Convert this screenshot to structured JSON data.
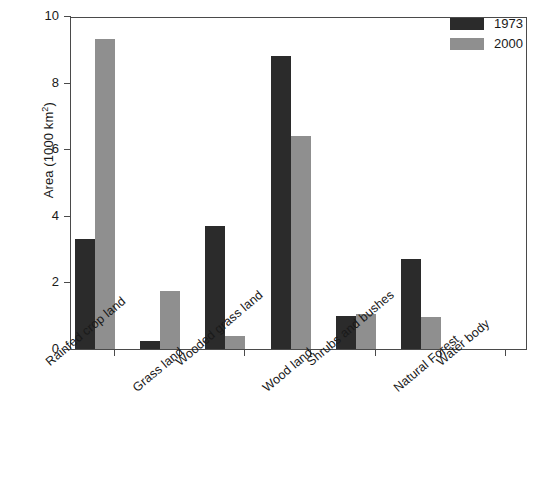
{
  "chart_data": {
    "type": "bar",
    "title": "",
    "xlabel": "",
    "ylabel": "Area (1000 km2)",
    "ylabel_text": "Area (1000 km",
    "ylabel_sup": "2",
    "ylabel_tail": ")",
    "ylim": [
      0,
      10
    ],
    "yticks": [
      0,
      2,
      4,
      6,
      8,
      10
    ],
    "ytick_labels": [
      "0",
      "2",
      "4",
      "6",
      "8",
      "10"
    ],
    "grid": false,
    "legend_position": "top-right",
    "categories": [
      "Rainfed crop land",
      "Grass land",
      "Wooded grass land",
      "Wood land",
      "Shrubs and bushes",
      "Natural Forest",
      "Water body"
    ],
    "series": [
      {
        "name": "1973",
        "color": "#2b2b2b",
        "values": [
          3.3,
          0.25,
          3.7,
          8.8,
          1.0,
          2.7,
          0
        ]
      },
      {
        "name": "2000",
        "color": "#8f8f8f",
        "values": [
          9.3,
          1.75,
          0.4,
          6.4,
          1.05,
          0.95,
          0
        ]
      }
    ]
  },
  "legend": {
    "entries": [
      {
        "label": "1973"
      },
      {
        "label": "2000"
      }
    ]
  }
}
